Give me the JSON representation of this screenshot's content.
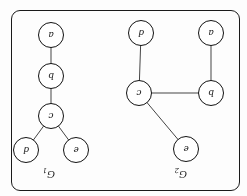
{
  "figure": {
    "orientation": "rotated-180",
    "border_color": "#1a1a1a",
    "node_fill": "#ffffff",
    "node_stroke": "#111111",
    "edge_color": "#444444",
    "background": "#fdfdfd",
    "width": 247,
    "height": 196
  },
  "graphs": [
    {
      "id": "G2",
      "title_letter": "G",
      "title_subscript": "2",
      "title_x": 60,
      "title_y": 16,
      "nodes": [
        {
          "id": "e",
          "label": "e",
          "cx": 61,
          "cy": 47,
          "r": 13
        },
        {
          "id": "b",
          "label": "b",
          "cx": 36,
          "cy": 103,
          "r": 13
        },
        {
          "id": "c",
          "label": "c",
          "cx": 108,
          "cy": 103,
          "r": 13
        },
        {
          "id": "a",
          "label": "a",
          "cx": 36,
          "cy": 163,
          "r": 13
        },
        {
          "id": "d",
          "label": "d",
          "cx": 106,
          "cy": 163,
          "r": 13
        }
      ],
      "edges": [
        {
          "from": "e",
          "to": "c"
        },
        {
          "from": "b",
          "to": "c"
        },
        {
          "from": "b",
          "to": "a"
        },
        {
          "from": "c",
          "to": "d"
        }
      ]
    },
    {
      "id": "G1",
      "title_letter": "G",
      "title_subscript": "1",
      "title_x": 192,
      "title_y": 16,
      "nodes": [
        {
          "id": "e",
          "label": "e",
          "cx": 171,
          "cy": 46,
          "r": 13
        },
        {
          "id": "d",
          "label": "d",
          "cx": 221,
          "cy": 46,
          "r": 13
        },
        {
          "id": "c",
          "label": "c",
          "cx": 196,
          "cy": 80,
          "r": 13
        },
        {
          "id": "b",
          "label": "b",
          "cx": 196,
          "cy": 120,
          "r": 13
        },
        {
          "id": "a",
          "label": "a",
          "cx": 196,
          "cy": 161,
          "r": 13
        }
      ],
      "edges": [
        {
          "from": "e",
          "to": "c"
        },
        {
          "from": "d",
          "to": "c"
        },
        {
          "from": "c",
          "to": "b"
        },
        {
          "from": "b",
          "to": "a"
        }
      ]
    }
  ]
}
